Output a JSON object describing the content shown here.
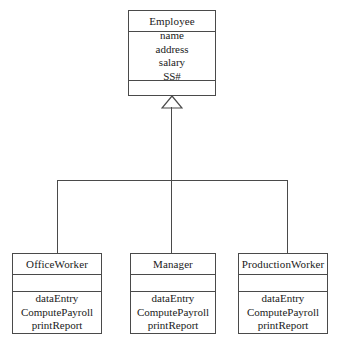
{
  "diagram": {
    "type": "uml-class-diagram",
    "relationship": "generalization",
    "colors": {
      "background": "#ffffff",
      "line": "#4a4a4a",
      "text": "#1a1a1a"
    },
    "superclass": {
      "name": "Employee",
      "attributes": [
        "name",
        "address",
        "salary",
        "SS#"
      ],
      "operations": []
    },
    "subclasses": [
      {
        "name": "OfficeWorker",
        "attributes": [],
        "operations": [
          "dataEntry",
          "ComputePayroll",
          "printReport"
        ]
      },
      {
        "name": "Manager",
        "attributes": [],
        "operations": [
          "dataEntry",
          "ComputePayroll",
          "printReport"
        ]
      },
      {
        "name": "ProductionWorker",
        "attributes": [],
        "operations": [
          "dataEntry",
          "ComputePayroll",
          "printReport"
        ]
      }
    ],
    "connector": {
      "arrow": "hollow-triangle-inheritance"
    }
  }
}
